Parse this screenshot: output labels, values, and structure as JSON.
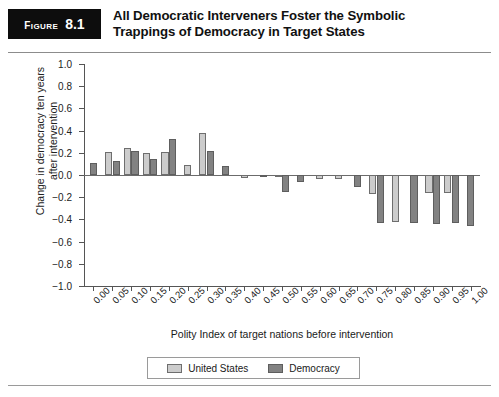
{
  "figure": {
    "badge_word": "Figure",
    "badge_number": "8.1",
    "title_line1": "All Democratic Interveners Foster the Symbolic",
    "title_line2": "Trappings of Democracy in Target States"
  },
  "colors": {
    "united_states": "#cccccc",
    "democracy": "#828282",
    "axis": "#555555",
    "badge_background": "#0d0d0d"
  },
  "legend": {
    "items": [
      {
        "label": "United States",
        "key": "us"
      },
      {
        "label": "Democracy",
        "key": "dem"
      }
    ]
  },
  "chart_data": {
    "type": "bar",
    "title": "All Democratic Interveners Foster the Symbolic Trappings of Democracy in Target States",
    "xlabel": "Polity Index of target nations before intervention",
    "ylabel": "Change in democracy ten years\nafter intervention",
    "categories": [
      "0.00",
      "0.05",
      "0.10",
      "0.15",
      "0.20",
      "0.25",
      "0.30",
      "0.35",
      "0.40",
      "0.45",
      "0.50",
      "0.55",
      "0.60",
      "0.65",
      "0.70",
      "0.75",
      "0.80",
      "0.85",
      "0.90",
      "0.95",
      "1.00"
    ],
    "ylim": [
      -1.0,
      1.0
    ],
    "yticks": [
      "1.0",
      "0.8",
      "0.6",
      "0.4",
      "0.2",
      "0.0",
      "-0.2",
      "-0.4",
      "-0.6",
      "-0.8",
      "-1.0"
    ],
    "ytick_values": [
      1.0,
      0.8,
      0.6,
      0.4,
      0.2,
      0.0,
      -0.2,
      -0.4,
      -0.6,
      -0.8,
      -1.0
    ],
    "grid": false,
    "legend_position": "bottom",
    "series": [
      {
        "name": "United States",
        "color": "#cccccc",
        "values": [
          null,
          0.21,
          0.24,
          0.2,
          0.21,
          0.09,
          0.38,
          null,
          -0.03,
          null,
          -0.02,
          null,
          -0.04,
          -0.04,
          null,
          -0.17,
          -0.42,
          null,
          -0.16,
          -0.16,
          null
        ]
      },
      {
        "name": "Democracy",
        "color": "#828282",
        "values": [
          0.11,
          0.13,
          0.22,
          0.14,
          0.32,
          null,
          0.22,
          0.08,
          null,
          -0.01,
          -0.15,
          -0.06,
          null,
          null,
          -0.11,
          -0.43,
          null,
          -0.43,
          -0.44,
          -0.43,
          -0.46
        ]
      }
    ]
  }
}
